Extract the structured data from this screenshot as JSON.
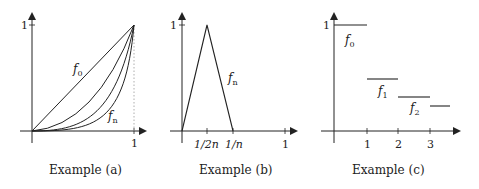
{
  "figure": {
    "panels": [
      {
        "id": "a",
        "caption": "Example (a)",
        "y_tick_label": "1",
        "x_tick_labels": [
          "1"
        ],
        "curve_labels": [
          {
            "base": "f",
            "sub": "0"
          },
          {
            "base": "f",
            "sub": "n"
          }
        ]
      },
      {
        "id": "b",
        "caption": "Example (b)",
        "y_tick_label": "1",
        "x_tick_labels": [
          "1/2n",
          "1/n",
          "1"
        ],
        "curve_labels": [
          {
            "base": "f",
            "sub": "n"
          }
        ]
      },
      {
        "id": "c",
        "caption": "Example (c)",
        "y_tick_label": "1",
        "x_tick_labels": [
          "1",
          "2",
          "3"
        ],
        "curve_labels": [
          {
            "base": "f",
            "sub": "0"
          },
          {
            "base": "f",
            "sub": "1"
          },
          {
            "base": "f",
            "sub": "2"
          }
        ]
      }
    ],
    "colors": {
      "stroke": "#222222",
      "dotted": "#999999",
      "background": "#ffffff"
    }
  }
}
